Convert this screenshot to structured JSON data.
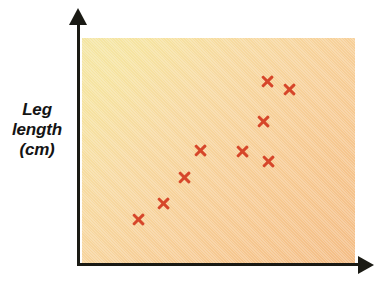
{
  "figure": {
    "background_color": "#ffffff",
    "panel_gradient_from": "#f4e6a4",
    "panel_gradient_to": "#f4bd86",
    "axis_color": "#1a1a14",
    "marker_color": "#d6462a"
  },
  "axis_labels": {
    "y_line1": "Leg",
    "y_line2": "length",
    "y_line3": "(cm)",
    "x_label": ""
  },
  "chart_data": {
    "type": "scatter",
    "title": "",
    "xlabel": "",
    "ylabel": "Leg length (cm)",
    "grid": false,
    "legend": false,
    "marker": "x",
    "marker_color": "#d6462a",
    "axis_ticks_shown": false,
    "xlim": [
      0,
      100
    ],
    "ylim": [
      0,
      100
    ],
    "series": [
      {
        "name": "observations",
        "points": [
          {
            "x": 21,
            "y": 20
          },
          {
            "x": 30,
            "y": 27
          },
          {
            "x": 38,
            "y": 39
          },
          {
            "x": 44,
            "y": 50
          },
          {
            "x": 59,
            "y": 50
          },
          {
            "x": 68,
            "y": 46
          },
          {
            "x": 67,
            "y": 63
          },
          {
            "x": 68,
            "y": 81
          },
          {
            "x": 76,
            "y": 78
          }
        ]
      }
    ],
    "point_pixels": [
      {
        "left": 139,
        "top": 219
      },
      {
        "left": 164,
        "top": 203
      },
      {
        "left": 185,
        "top": 177
      },
      {
        "left": 201,
        "top": 150
      },
      {
        "left": 243,
        "top": 151
      },
      {
        "left": 269,
        "top": 161
      },
      {
        "left": 264,
        "top": 121
      },
      {
        "left": 268,
        "top": 81
      },
      {
        "left": 290,
        "top": 89
      }
    ],
    "n_points": 9,
    "relationship": "positive correlation"
  }
}
